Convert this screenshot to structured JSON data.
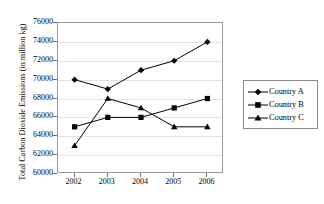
{
  "chart_data": {
    "type": "line",
    "title": "",
    "xlabel": "",
    "ylabel": "Total Carbon Dioxide Emissions (in million kg)",
    "categories": [
      "2002",
      "2003",
      "2004",
      "2005",
      "2006"
    ],
    "x_tick_labels": [
      "2002",
      "2003",
      "2004",
      "2005",
      "2006"
    ],
    "y_tick_labels": [
      "60000",
      "62000",
      "64000",
      "66000",
      "68000",
      "70000",
      "72000",
      "74000",
      "76000"
    ],
    "ylim": [
      60000,
      76000
    ],
    "y_tick_step": 2000,
    "grid": true,
    "legend_position": "right",
    "series": [
      {
        "name": "Country A",
        "marker": "diamond",
        "color": "#000000",
        "values": [
          70000,
          69000,
          71000,
          72000,
          74000
        ]
      },
      {
        "name": "Country B",
        "marker": "square",
        "color": "#000000",
        "values": [
          65000,
          66000,
          66000,
          67000,
          68000
        ]
      },
      {
        "name": "Country C",
        "marker": "triangle",
        "color": "#000000",
        "values": [
          63000,
          68000,
          67000,
          65000,
          65000
        ]
      }
    ]
  },
  "legend": {
    "items": [
      {
        "label": "Country A",
        "marker": "diamond-marker-icon"
      },
      {
        "label": "Country B",
        "marker": "square-marker-icon"
      },
      {
        "label": "Country C",
        "marker": "triangle-marker-icon"
      }
    ]
  }
}
